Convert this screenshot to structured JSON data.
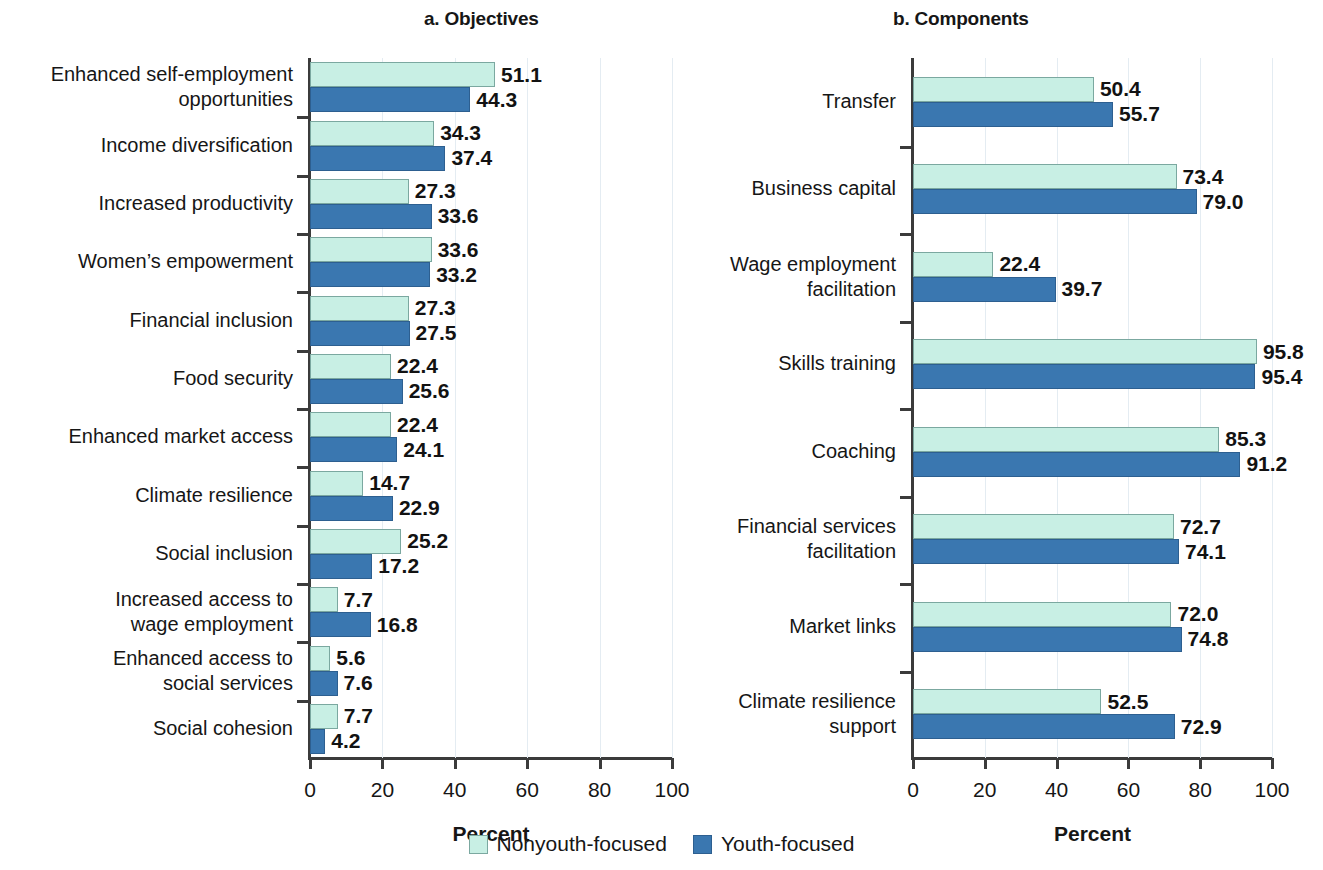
{
  "figure": {
    "legend": {
      "position": "bottom-center",
      "items": [
        {
          "label": "Nonyouth-focused",
          "color": "#c8efe4",
          "key": "nonyouth"
        },
        {
          "label": "Youth-focused",
          "color": "#3a77b0",
          "key": "youth"
        }
      ]
    }
  },
  "chart_data": [
    {
      "type": "bar",
      "orientation": "horizontal",
      "title": "a. Objectives",
      "xlabel": "Percent",
      "ylabel": "",
      "xlim": [
        0,
        100
      ],
      "xticks": [
        0,
        20,
        40,
        60,
        80,
        100
      ],
      "grid": true,
      "legend": [
        "Nonyouth-focused",
        "Youth-focused"
      ],
      "categories": [
        "Enhanced self-employment\nopportunities",
        "Income diversification",
        "Increased productivity",
        "Women’s empowerment",
        "Financial inclusion",
        "Food security",
        "Enhanced market access",
        "Climate resilience",
        "Social inclusion",
        "Increased access to\nwage employment",
        "Enhanced access to\nsocial services",
        "Social cohesion"
      ],
      "series": [
        {
          "name": "Nonyouth-focused",
          "color": "#c8efe4",
          "values": [
            51.1,
            34.3,
            27.3,
            33.6,
            27.3,
            22.4,
            22.4,
            14.7,
            25.2,
            7.7,
            5.6,
            7.7
          ],
          "labels": [
            "51.1",
            "34.3",
            "27.3",
            "33.6",
            "27.3",
            "22.4",
            "22.4",
            "14.7",
            "25.2",
            "7.7",
            "5.6",
            "7.7"
          ]
        },
        {
          "name": "Youth-focused",
          "color": "#3a77b0",
          "values": [
            44.3,
            37.4,
            33.6,
            33.2,
            27.5,
            25.6,
            24.1,
            22.9,
            17.2,
            16.8,
            7.6,
            4.2
          ],
          "labels": [
            "44.3",
            "37.4",
            "33.6",
            "33.2",
            "27.5",
            "25.6",
            "24.1",
            "22.9",
            "17.2",
            "16.8",
            "7.6",
            "4.2"
          ]
        }
      ]
    },
    {
      "type": "bar",
      "orientation": "horizontal",
      "title": "b. Components",
      "xlabel": "Percent",
      "ylabel": "",
      "xlim": [
        0,
        100
      ],
      "xticks": [
        0,
        20,
        40,
        60,
        80,
        100
      ],
      "grid": true,
      "legend": [
        "Nonyouth-focused",
        "Youth-focused"
      ],
      "categories": [
        "Transfer",
        "Business capital",
        "Wage employment\nfacilitation",
        "Skills training",
        "Coaching",
        "Financial services\nfacilitation",
        "Market links",
        "Climate resilience\nsupport"
      ],
      "series": [
        {
          "name": "Nonyouth-focused",
          "color": "#c8efe4",
          "values": [
            50.4,
            73.4,
            22.4,
            95.8,
            85.3,
            72.7,
            72.0,
            52.5
          ],
          "labels": [
            "50.4",
            "73.4",
            "22.4",
            "95.8",
            "85.3",
            "72.7",
            "72.0",
            "52.5"
          ]
        },
        {
          "name": "Youth-focused",
          "color": "#3a77b0",
          "values": [
            55.7,
            79.0,
            39.7,
            95.4,
            91.2,
            74.1,
            74.8,
            72.9
          ],
          "labels": [
            "55.7",
            "79.0",
            "39.7",
            "95.4",
            "91.2",
            "74.1",
            "74.8",
            "72.9"
          ]
        }
      ]
    }
  ]
}
